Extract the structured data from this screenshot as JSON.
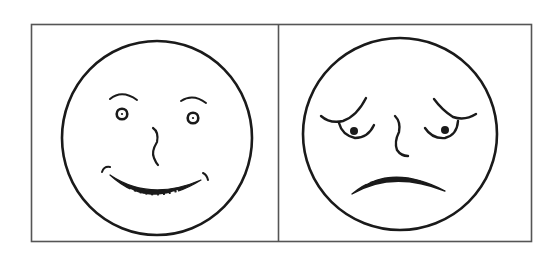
{
  "figure": {
    "panels": [
      {
        "id": "happy",
        "expression": "happy",
        "icon": "happy-face-icon"
      },
      {
        "id": "sad",
        "expression": "sad",
        "icon": "sad-face-icon"
      }
    ],
    "colors": {
      "line": "#1a1a1a",
      "background": "#ffffff",
      "border": "#555555"
    }
  }
}
